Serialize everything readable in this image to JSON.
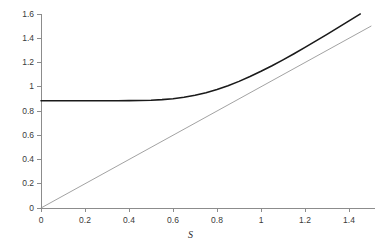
{
  "chart_data": {
    "type": "line",
    "title": "",
    "subtitle": "",
    "xlabel": "S",
    "ylabel": "",
    "xlim": [
      0,
      1.5
    ],
    "ylim": [
      0,
      1.6
    ],
    "grid": false,
    "legend": "none",
    "xticks": [
      0,
      0.2,
      0.4,
      0.6,
      0.8,
      1,
      1.2,
      1.4
    ],
    "xtick_labels": [
      "0",
      "0.2",
      "0.4",
      "0.6",
      "0.8",
      "1",
      "1.2",
      "1.4"
    ],
    "yticks": [
      0,
      0.2,
      0.4,
      0.6,
      0.8,
      1,
      1.2,
      1.4,
      1.6
    ],
    "ytick_labels": [
      "0",
      "0.2",
      "0.4",
      "0.6",
      "0.8",
      "1",
      "1.2",
      "1.4",
      "1.6"
    ],
    "axis_color": "#8c8c8c",
    "series": [
      {
        "name": "option-value-curve",
        "color": "#1a1a1a",
        "width": 1.6,
        "x": [
          0,
          0.05,
          0.1,
          0.15,
          0.2,
          0.25,
          0.3,
          0.35,
          0.4,
          0.45,
          0.5,
          0.55,
          0.6,
          0.65,
          0.7,
          0.75,
          0.8,
          0.85,
          0.9,
          0.95,
          1,
          1.05,
          1.1,
          1.15,
          1.2,
          1.25,
          1.3,
          1.35,
          1.4,
          1.45,
          1.5
        ],
        "y": [
          0.885,
          0.885,
          0.885,
          0.885,
          0.885,
          0.885,
          0.885,
          0.8851,
          0.8854,
          0.8864,
          0.8888,
          0.8935,
          0.9014,
          0.9133,
          0.9298,
          0.9512,
          0.9776,
          1.0088,
          1.0444,
          1.084,
          1.1272,
          1.1733,
          1.2219,
          1.2725,
          1.3247,
          1.3781,
          1.4324,
          1.4874,
          1.5429,
          1.5988,
          1.6549
        ]
      },
      {
        "name": "intrinsic-value-line",
        "color": "#8a8a8a",
        "width": 0.8,
        "x": [
          0,
          1.5
        ],
        "y": [
          0,
          1.5
        ]
      }
    ],
    "annotations": []
  }
}
